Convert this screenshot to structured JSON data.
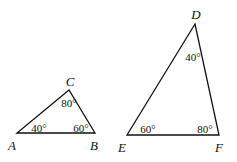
{
  "diagram": {
    "type": "similar-triangles",
    "triangles": [
      {
        "name": "triangle-abc",
        "vertices": [
          {
            "label": "A",
            "x": 17,
            "y": 133,
            "label_x": 12,
            "label_y": 150,
            "anchor": "middle"
          },
          {
            "label": "B",
            "x": 95,
            "y": 133,
            "label_x": 94,
            "label_y": 150,
            "anchor": "middle"
          },
          {
            "label": "C",
            "x": 69,
            "y": 90,
            "label_x": 70,
            "label_y": 86,
            "anchor": "middle"
          }
        ],
        "angles": [
          {
            "vertex": "A",
            "value": "40°",
            "x": 39,
            "y": 132
          },
          {
            "vertex": "B",
            "value": "60°",
            "x": 81,
            "y": 132
          },
          {
            "vertex": "C",
            "value": "80°",
            "x": 69,
            "y": 107
          }
        ]
      },
      {
        "name": "triangle-def",
        "vertices": [
          {
            "label": "D",
            "x": 195,
            "y": 24,
            "label_x": 196,
            "label_y": 19,
            "anchor": "middle"
          },
          {
            "label": "E",
            "x": 127,
            "y": 135,
            "label_x": 122,
            "label_y": 152,
            "anchor": "middle"
          },
          {
            "label": "F",
            "x": 219,
            "y": 135,
            "label_x": 219,
            "label_y": 152,
            "anchor": "middle"
          }
        ],
        "angles": [
          {
            "vertex": "D",
            "value": "40°",
            "x": 193,
            "y": 61
          },
          {
            "vertex": "E",
            "value": "60°",
            "x": 148,
            "y": 133
          },
          {
            "vertex": "F",
            "value": "80°",
            "x": 205,
            "y": 133
          }
        ]
      }
    ]
  }
}
